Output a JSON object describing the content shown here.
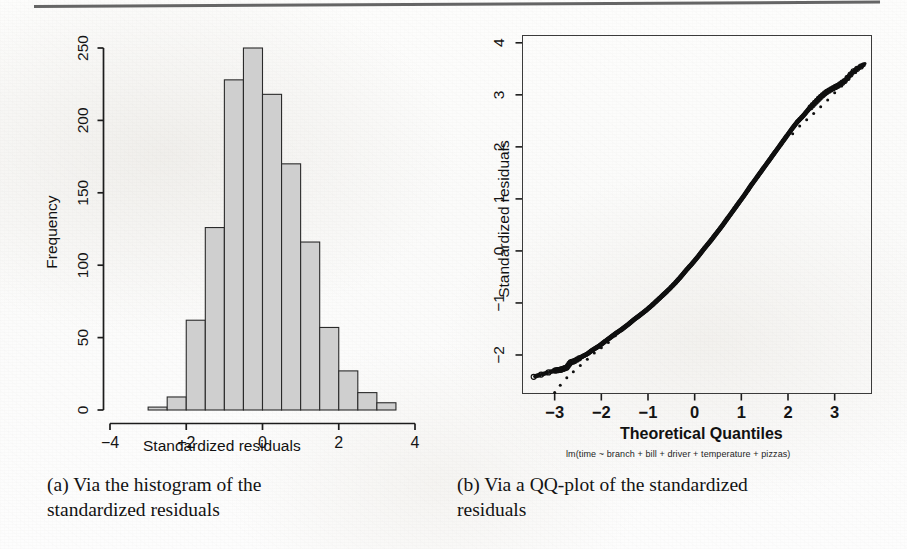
{
  "figure": {
    "top_rule": "horizontal-rule"
  },
  "panel_a": {
    "caption_line1": "(a) Via the histogram of the",
    "caption_line2": "standardized residuals",
    "xlabel": "Standardized residuals",
    "ylabel": "Frequency",
    "xticks": [
      "-4",
      "-2",
      "0",
      "2",
      "4"
    ],
    "yticks": [
      "0",
      "50",
      "100",
      "150",
      "200",
      "250"
    ]
  },
  "panel_b": {
    "caption_line1": "(b) Via a QQ-plot of the standardized",
    "caption_line2": "residuals",
    "xlabel": "Theoretical Quantiles",
    "ylabel": "Standardized residuals",
    "subtitle": "lm(time ~ branch + bill + driver + temperature + pizzas)",
    "xticks": [
      "-3",
      "-2",
      "-1",
      "0",
      "1",
      "2",
      "3"
    ],
    "yticks": [
      "-2",
      "-1",
      "0",
      "1",
      "2",
      "3",
      "4"
    ]
  },
  "chart_data": [
    {
      "type": "bar",
      "title": "",
      "subtitle": "",
      "xlabel": "Standardized residuals",
      "ylabel": "Frequency",
      "xlim": [
        -4.3,
        4.0
      ],
      "ylim": [
        0,
        258
      ],
      "grid": false,
      "legend": "none",
      "bin_width": 0.5,
      "bin_edges": [
        -3.0,
        -2.5,
        -2.0,
        -1.5,
        -1.0,
        -0.5,
        0.0,
        0.5,
        1.0,
        1.5,
        2.0,
        2.5,
        3.0,
        3.5
      ],
      "categories": [
        "[-3.0,-2.5)",
        "[-2.5,-2.0)",
        "[-2.0,-1.5)",
        "[-1.5,-1.0)",
        "[-1.0,-0.5)",
        "[-0.5,0.0)",
        "[0.0,0.5)",
        "[0.5,1.0)",
        "[1.0,1.5)",
        "[1.5,2.0)",
        "[2.0,2.5)",
        "[2.5,3.0)",
        "[3.0,3.5)"
      ],
      "values": [
        2,
        9,
        62,
        126,
        228,
        250,
        218,
        170,
        116,
        57,
        27,
        12,
        5
      ],
      "xticks": [
        -4,
        -2,
        0,
        2,
        4
      ],
      "yticks": [
        0,
        50,
        100,
        150,
        200,
        250
      ],
      "bar_fill": "#cfcfcf",
      "bar_stroke": "#2a2a2a"
    },
    {
      "type": "scatter",
      "title": "",
      "subtitle": "lm(time ~ branch + bill + driver + temperature + pizzas)",
      "xlabel": "Theoretical Quantiles",
      "ylabel": "Standardized residuals",
      "xlim": [
        -3.7,
        3.8
      ],
      "ylim": [
        -2.75,
        4.15
      ],
      "grid": false,
      "legend": "none",
      "box": true,
      "xticks": [
        -3,
        -2,
        -1,
        0,
        1,
        2,
        3
      ],
      "yticks": [
        -2,
        -1,
        0,
        1,
        2,
        3,
        4
      ],
      "series": [
        {
          "name": "standardized residuals vs theoretical quantiles",
          "marker": "open-circle",
          "color": "#101010",
          "points": [
            [
              -3.45,
              -2.42
            ],
            [
              -3.0,
              -2.3
            ],
            [
              -2.92,
              -2.29
            ],
            [
              -2.86,
              -2.28
            ],
            [
              -2.8,
              -2.26
            ],
            [
              -2.74,
              -2.24
            ],
            [
              -2.66,
              -2.14
            ],
            [
              -2.58,
              -2.12
            ],
            [
              -2.45,
              -2.05
            ],
            [
              -2.3,
              -1.98
            ],
            [
              -2.18,
              -1.9
            ],
            [
              -2.05,
              -1.83
            ],
            [
              -1.92,
              -1.74
            ],
            [
              -1.8,
              -1.66
            ],
            [
              -1.68,
              -1.58
            ],
            [
              -1.55,
              -1.5
            ],
            [
              -1.42,
              -1.41
            ],
            [
              -1.3,
              -1.32
            ],
            [
              -1.18,
              -1.24
            ],
            [
              -1.05,
              -1.15
            ],
            [
              -0.92,
              -1.05
            ],
            [
              -0.8,
              -0.95
            ],
            [
              -0.68,
              -0.85
            ],
            [
              -0.55,
              -0.74
            ],
            [
              -0.42,
              -0.62
            ],
            [
              -0.3,
              -0.5
            ],
            [
              -0.18,
              -0.37
            ],
            [
              -0.05,
              -0.24
            ],
            [
              0.08,
              -0.1
            ],
            [
              0.2,
              0.04
            ],
            [
              0.33,
              0.18
            ],
            [
              0.45,
              0.32
            ],
            [
              0.58,
              0.47
            ],
            [
              0.7,
              0.62
            ],
            [
              0.83,
              0.78
            ],
            [
              0.95,
              0.93
            ],
            [
              1.08,
              1.09
            ],
            [
              1.2,
              1.25
            ],
            [
              1.33,
              1.41
            ],
            [
              1.45,
              1.56
            ],
            [
              1.58,
              1.72
            ],
            [
              1.7,
              1.87
            ],
            [
              1.83,
              2.03
            ],
            [
              1.95,
              2.18
            ],
            [
              2.08,
              2.34
            ],
            [
              2.2,
              2.48
            ],
            [
              2.33,
              2.6
            ],
            [
              2.45,
              2.73
            ],
            [
              2.58,
              2.85
            ],
            [
              2.7,
              2.96
            ],
            [
              2.82,
              3.05
            ],
            [
              2.95,
              3.12
            ],
            [
              3.08,
              3.18
            ],
            [
              3.22,
              3.27
            ],
            [
              3.4,
              3.45
            ],
            [
              3.62,
              3.58
            ]
          ]
        },
        {
          "name": "reference normal line (dotted)",
          "marker": "small-dot",
          "color": "#101010",
          "points": [
            [
              -3.0,
              -2.72
            ],
            [
              -2.88,
              -2.58
            ],
            [
              -2.74,
              -2.44
            ],
            [
              -2.6,
              -2.32
            ],
            [
              -2.45,
              -2.2
            ],
            [
              -2.3,
              -2.08
            ],
            [
              -2.15,
              -1.96
            ],
            [
              -2.0,
              -1.86
            ],
            [
              -1.85,
              -1.76
            ],
            [
              -1.7,
              -1.63
            ],
            [
              -1.55,
              -1.52
            ],
            [
              -1.4,
              -1.4
            ],
            [
              2.1,
              2.25
            ],
            [
              2.25,
              2.4
            ],
            [
              2.4,
              2.52
            ],
            [
              2.55,
              2.64
            ],
            [
              2.7,
              2.77
            ],
            [
              2.85,
              2.9
            ],
            [
              3.0,
              3.04
            ],
            [
              3.15,
              3.17
            ],
            [
              3.3,
              3.3
            ],
            [
              3.45,
              3.43
            ],
            [
              3.65,
              3.6
            ]
          ]
        }
      ]
    }
  ]
}
